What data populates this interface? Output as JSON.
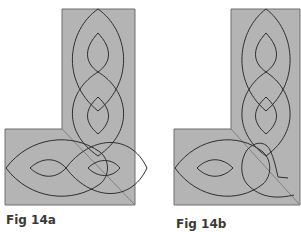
{
  "colors": {
    "background": "#ffffff",
    "panel_fill": "#b4b4b4",
    "panel_edge": "#6e6e6e",
    "line": "#2e2e2e",
    "diagonal": "#808080"
  },
  "figures": [
    {
      "id": "fig-14a",
      "caption": "Fig 14a",
      "panel": "M62,9 L135,9 L135,205 L5,205 L5,129 L62,129 Z",
      "diagonal": "M62,129 L135,205",
      "lines": [
        "M98,9 C128,30 136,80 98,111 C60,80 68,30 98,9 Z",
        "M98,33 C112,48 112,62 98,72 C84,62 84,48 98,33 Z",
        "M98,72 C128,90 136,130 98,156 C60,130 68,90 98,72 Z",
        "M98,97 C112,110 112,122 98,134 C84,122 84,110 98,97 Z",
        "M6,168 C30,136 72,132 100,152 C110,160 110,176 100,184 C72,204 30,200 6,168 Z",
        "M30,168 C42,157 56,157 66,168 C56,179 42,179 30,168 Z",
        "M66,168 C90,136 130,132 147,168 C130,204 90,200 66,168 Z",
        "M88,168 C98,158 112,158 120,168 C112,178 98,178 88,168 Z"
      ],
      "caption_pos": [
        6,
        225
      ]
    },
    {
      "id": "fig-14b",
      "caption": "Fig 14b",
      "panel": "M231,9 L300,9 L300,205 L174,205 L174,129 L231,129 Z",
      "diagonal": "M231,129 L300,205",
      "lines": [
        "M266,9 C294,30 302,80 266,111 C230,80 238,30 266,9 Z",
        "M266,33 C280,48 280,62 266,72 C252,62 252,48 266,33 Z",
        "M266,72 C294,90 302,130 266,156 C230,130 238,90 266,72 Z",
        "M266,97 C280,110 280,122 266,134 C252,122 252,110 266,97 Z",
        "M175,168 C198,136 238,132 263,152 C272,160 272,176 263,184 C238,204 198,200 175,168 Z",
        "M197,168 C208,157 222,157 233,168 C222,179 208,179 197,168 Z",
        "M247,150 C240,160 240,176 247,184 C262,200 280,198 294,195",
        "M247,150 C256,140 266,142 270,150 C274,158 276,168 278,177 L288,178"
      ],
      "caption_pos": [
        176,
        229
      ]
    }
  ]
}
